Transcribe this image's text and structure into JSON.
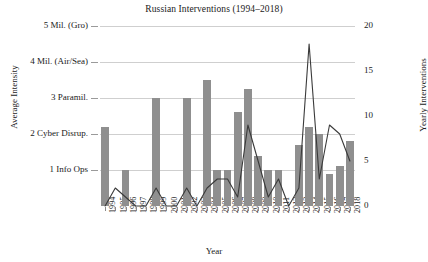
{
  "chart_data": {
    "type": "bar",
    "title": "Russian Interventions (1994–2018)",
    "xlabel": "Year",
    "ylabel": "Average Intensity",
    "y2label": "Yearly Interventions",
    "categories": [
      "1994",
      "1995",
      "1996",
      "1997",
      "1998",
      "1999",
      "2000",
      "2001",
      "2002",
      "2003",
      "2004",
      "2005",
      "2006",
      "2007",
      "2008",
      "2009",
      "2010",
      "2011",
      "2012",
      "2013",
      "2014",
      "2015",
      "2016",
      "2017",
      "2018"
    ],
    "ylim": [
      0,
      5
    ],
    "y2lim": [
      0,
      20
    ],
    "y_tick_values": [
      1,
      2,
      3,
      4,
      5
    ],
    "y_tick_labels": [
      "1 Info Ops",
      "2 Cyber Disrup.",
      "3 Paramil.",
      "4 Mil. (Air/Sea)",
      "5 Mil. (Gro)"
    ],
    "y2_tick_values": [
      0,
      5,
      10,
      15,
      20
    ],
    "y2_tick_labels": [
      "0",
      "5",
      "10",
      "15",
      "20"
    ],
    "grid": true,
    "legend": "none",
    "bar_color": "#8f8f8f",
    "line_color": "#3a3a3a",
    "series": [
      {
        "name": "Average Intensity",
        "type": "bar",
        "axis": "left",
        "values": [
          2.2,
          0,
          1.0,
          0,
          0,
          3.0,
          0,
          0,
          3.0,
          0,
          3.5,
          1.0,
          1.0,
          2.6,
          3.25,
          1.4,
          1.0,
          1.0,
          0,
          1.7,
          2.2,
          2.0,
          0.9,
          1.1,
          1.8
        ]
      },
      {
        "name": "Yearly Interventions",
        "type": "line",
        "axis": "right",
        "values": [
          0,
          2,
          1,
          0,
          0,
          2,
          0,
          0,
          2,
          0,
          2,
          3,
          3,
          1,
          9,
          5,
          1,
          3,
          0,
          2,
          18,
          3,
          9,
          8,
          5
        ]
      }
    ]
  }
}
